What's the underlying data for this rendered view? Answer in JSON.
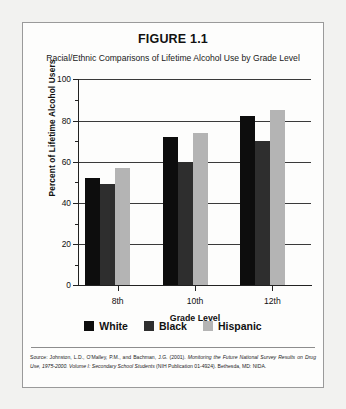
{
  "figure": {
    "title": "FIGURE 1.1",
    "subtitle": "Racial/Ethnic Comparisons of Lifetime Alcohol Use by Grade Level",
    "source_prefix": "Source: Johnston, L.D., O'Malley, P.M., and Bachman, J.G. (2001). ",
    "source_italic": "Monitoring the Future National Survey Results on Drug Use, 1975-2000. Volume I: Secondary School Students",
    "source_suffix": " (NIH Publication 01-4924). Bethesda, MD: NIDA."
  },
  "colors": {
    "white_series": "#0d0d0d",
    "black_series": "#2e2e2e",
    "hispanic_series": "#b4b4b4",
    "frame": "#9a9a9a",
    "axis": "#222222",
    "page_background": "#f2f2f0",
    "panel_background": "#fdfdfc"
  },
  "chart_data": {
    "type": "bar",
    "title": "FIGURE 1.1",
    "subtitle": "Racial/Ethnic Comparisons of Lifetime Alcohol Use by Grade Level",
    "xlabel": "Grade Level",
    "ylabel": "Percent of Lifetime Alcohol Users",
    "categories": [
      "8th",
      "10th",
      "12th"
    ],
    "series": [
      {
        "name": "White",
        "values": [
          52,
          72,
          82
        ]
      },
      {
        "name": "Black",
        "values": [
          49,
          60,
          70
        ]
      },
      {
        "name": "Hispanic",
        "values": [
          57,
          74,
          85
        ]
      }
    ],
    "ylim": [
      0,
      100
    ],
    "yticks": [
      0,
      20,
      40,
      60,
      80,
      100
    ],
    "ytick_labels": [
      "0",
      "20",
      "40",
      "60",
      "80",
      "100"
    ],
    "yminor_ticks": [
      10,
      30,
      50,
      70,
      90
    ],
    "grid": true,
    "grid_axis": "y",
    "legend_position": "bottom",
    "legend": [
      "White",
      "Black",
      "Hispanic"
    ]
  }
}
